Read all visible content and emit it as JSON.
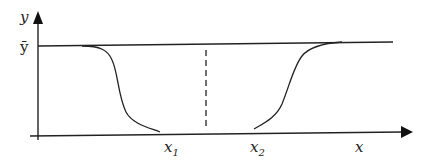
{
  "diagram": {
    "type": "profile-curve",
    "axes": {
      "x_label": "x",
      "y_label": "y",
      "y_level_label": "ȳ"
    },
    "markers": {
      "x1": {
        "base": "x",
        "sub": "1"
      },
      "x2": {
        "base": "x",
        "sub": "2"
      }
    },
    "elements": [
      "horizontal line at y-bar level",
      "left decreasing sigmoid curve ending at x1",
      "right increasing sigmoid curve starting at x2",
      "vertical dashed line at midpoint between x1 and x2"
    ],
    "colors": {
      "stroke": "#222222",
      "background": "#ffffff"
    }
  }
}
